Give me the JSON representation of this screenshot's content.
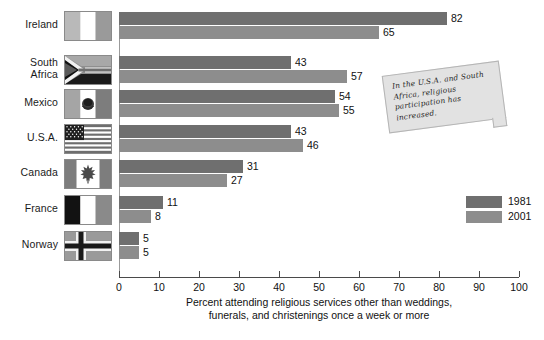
{
  "chart_data": {
    "type": "bar",
    "title": "",
    "xlabel": "Percent attending religious services other than weddings, funerals, and christenings once a week or more",
    "ylabel": "",
    "xlim": [
      0,
      100
    ],
    "grid": false,
    "orientation": "horizontal",
    "legend_position": "right",
    "categories": [
      "Ireland",
      "South Africa",
      "Mexico",
      "U.S.A.",
      "Canada",
      "France",
      "Norway"
    ],
    "series": [
      {
        "name": "1981",
        "color": "#6f6f6f",
        "values": [
          82,
          43,
          54,
          43,
          31,
          11,
          5
        ]
      },
      {
        "name": "2001",
        "color": "#8d8d8d",
        "values": [
          65,
          57,
          55,
          46,
          27,
          8,
          5
        ]
      }
    ],
    "xticks": [
      0,
      10,
      20,
      30,
      40,
      50,
      60,
      70,
      80,
      90,
      100
    ],
    "annotation": "In the U.S.A. and South Africa, religious participation has increased."
  },
  "axis": {
    "title_line1": "Percent attending religious services other than weddings,",
    "title_line2": "funerals, and christenings once a week or more",
    "ticks": [
      "0",
      "10",
      "20",
      "30",
      "40",
      "50",
      "60",
      "70",
      "80",
      "90",
      "100"
    ]
  },
  "rows": [
    {
      "label": "Ireland",
      "label_line1": "Ireland",
      "label_line2": "",
      "flag": "flag-ireland",
      "v1981": "82",
      "v2001": "65"
    },
    {
      "label": "South Africa",
      "label_line1": "South",
      "label_line2": "Africa",
      "flag": "flag-south-africa",
      "v1981": "43",
      "v2001": "57"
    },
    {
      "label": "Mexico",
      "label_line1": "Mexico",
      "label_line2": "",
      "flag": "flag-mexico",
      "v1981": "54",
      "v2001": "55"
    },
    {
      "label": "U.S.A.",
      "label_line1": "U.S.A.",
      "label_line2": "",
      "flag": "flag-usa",
      "v1981": "43",
      "v2001": "46"
    },
    {
      "label": "Canada",
      "label_line1": "Canada",
      "label_line2": "",
      "flag": "flag-canada",
      "v1981": "31",
      "v2001": "27"
    },
    {
      "label": "France",
      "label_line1": "France",
      "label_line2": "",
      "flag": "flag-france",
      "v1981": "11",
      "v2001": "8"
    },
    {
      "label": "Norway",
      "label_line1": "Norway",
      "label_line2": "",
      "flag": "flag-norway",
      "v1981": "5",
      "v2001": "5"
    }
  ],
  "legend": {
    "items": [
      {
        "label": "1981",
        "color": "#6f6f6f"
      },
      {
        "label": "2001",
        "color": "#8d8d8d"
      }
    ]
  },
  "note": {
    "text": "In the U.S.A. and South Africa, religious participation has increased."
  },
  "colors": {
    "bar_1981": "#6f6f6f",
    "bar_2001": "#8d8d8d",
    "note_bg": "#e2e2e2",
    "axis": "#4a4a4a"
  }
}
